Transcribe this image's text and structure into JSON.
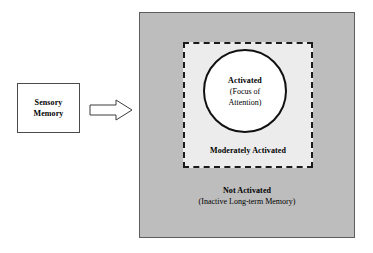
{
  "diagram": {
    "sensory_memory": {
      "line1": "Sensory",
      "line2": "Memory",
      "icon": "rectangle-box"
    },
    "arrow": {
      "icon": "right-block-arrow",
      "direction": "right"
    },
    "not_activated": {
      "title": "Not Activated",
      "subtitle": "(Inactive Long-term Memory)"
    },
    "moderately_activated": {
      "title": "Moderately Activated"
    },
    "activated": {
      "title": "Activated",
      "subtitle_line1": "(Focus of",
      "subtitle_line2": "Attention)"
    },
    "colors": {
      "page_background": "#ffffff",
      "not_activated_fill": "#bdbdbd",
      "not_activated_border": "#5d5d5d",
      "moderately_activated_fill": "#ececec",
      "moderately_activated_border": "#1a1a1a",
      "activated_fill": "#ffffff",
      "activated_border": "#111111",
      "sensory_memory_fill": "#ffffff",
      "sensory_memory_border": "#4a4a4a",
      "text": "#000000"
    }
  }
}
